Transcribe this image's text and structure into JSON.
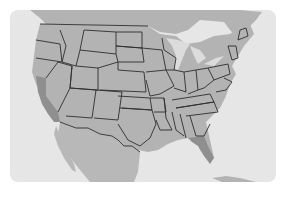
{
  "map": {
    "title": "",
    "region": "United States (contiguous) with Mexico and Caribbean",
    "colors": {
      "background": "#ffffff",
      "water": "#e6e6e6",
      "land": "#b3b3b3",
      "highlight": "#8f8f8f",
      "border": "#2e2e2e"
    },
    "highlighted_states": [
      "California",
      "Florida"
    ],
    "labels": []
  }
}
